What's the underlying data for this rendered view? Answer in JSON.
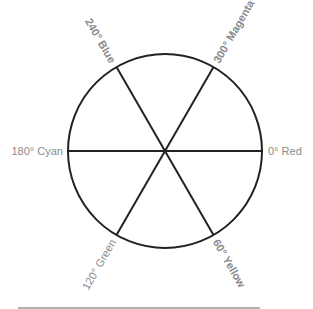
{
  "diagram": {
    "center": {
      "x": 165,
      "y": 151
    },
    "radius": 97,
    "stroke_color": "#222222",
    "label_color": "#8a8a8a",
    "footer_line_color": "#999999",
    "hues": [
      {
        "angle": 0,
        "label": "0° Red"
      },
      {
        "angle": 60,
        "label": "60° Yellow"
      },
      {
        "angle": 120,
        "label": "120° Green"
      },
      {
        "angle": 180,
        "label": "180° Cyan"
      },
      {
        "angle": 240,
        "label": "240° Blue"
      },
      {
        "angle": 300,
        "label": "300° Magenta"
      }
    ]
  }
}
